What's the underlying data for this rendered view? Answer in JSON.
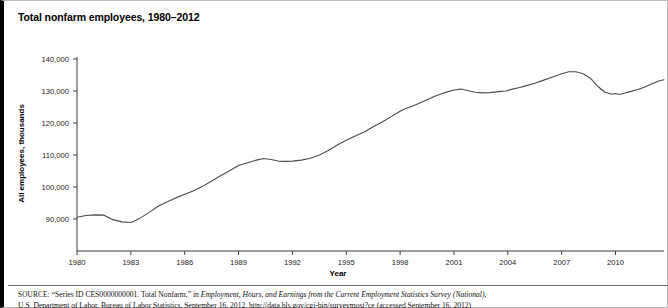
{
  "chart_title": "Total nonfarm employees, 1980–2012",
  "axis": {
    "y_title": "All employees, thousands",
    "x_title": "Year"
  },
  "source": {
    "label": "SOURCE:",
    "line1_plain_a": " “Series ID CES0000000001. Total Nonfarm,” in ",
    "line1_italic": "Employment, Hours, and Earnings from the Current Employment Statistics Survey (National),",
    "line2": "U.S. Department of Labor, Bureau of Labor Statistics, September 16, 2012, http://data.bls.gov/cgi-bin/surveymost?ce (accessed September 16, 2012)"
  },
  "chart_data": {
    "type": "line",
    "title": "Total nonfarm employees, 1980–2012",
    "xlabel": "Year",
    "ylabel": "All employees, thousands",
    "xlim": [
      1980,
      2012.7
    ],
    "ylim": [
      84000,
      142000
    ],
    "grid": false,
    "legend": "none",
    "x_ticks": [
      1980,
      1983,
      1986,
      1989,
      1992,
      1995,
      1998,
      2001,
      2004,
      2007,
      2010
    ],
    "y_ticks": [
      90000,
      100000,
      110000,
      120000,
      130000,
      140000
    ],
    "y_tick_labels": [
      "90,000",
      "100,000",
      "110,000",
      "120,000",
      "130,000",
      "140,000"
    ],
    "series": [
      {
        "name": "Total nonfarm employees",
        "color": "#4a4a4a",
        "x": [
          1980.0,
          1980.5,
          1981.0,
          1981.5,
          1982.0,
          1982.5,
          1983.0,
          1983.2,
          1983.5,
          1984.0,
          1984.5,
          1985.0,
          1985.5,
          1986.0,
          1986.5,
          1987.0,
          1987.5,
          1988.0,
          1988.5,
          1989.0,
          1989.5,
          1990.0,
          1990.4,
          1990.8,
          1991.2,
          1991.6,
          1992.0,
          1992.5,
          1993.0,
          1993.5,
          1994.0,
          1994.5,
          1995.0,
          1995.5,
          1996.0,
          1996.5,
          1997.0,
          1997.5,
          1998.0,
          1998.3,
          1998.6,
          1999.0,
          1999.5,
          2000.0,
          2000.5,
          2001.0,
          2001.4,
          2001.8,
          2002.2,
          2002.6,
          2003.0,
          2003.5,
          2003.9,
          2004.2,
          2004.6,
          2005.0,
          2005.5,
          2006.0,
          2006.5,
          2007.0,
          2007.4,
          2007.8,
          2008.2,
          2008.6,
          2009.0,
          2009.4,
          2009.8,
          2010.0,
          2010.2,
          2010.5,
          2010.8,
          2011.2,
          2011.6,
          2012.0,
          2012.4,
          2012.7
        ],
        "y": [
          90533,
          91100,
          91300,
          91200,
          89800,
          89100,
          88900,
          89400,
          90200,
          92000,
          93900,
          95300,
          96600,
          97700,
          98800,
          100200,
          101900,
          103500,
          105100,
          106700,
          107600,
          108400,
          108900,
          108600,
          108100,
          108000,
          108100,
          108400,
          109000,
          110000,
          111400,
          113100,
          114600,
          115900,
          117200,
          118800,
          120300,
          122000,
          123700,
          124500,
          125100,
          126000,
          127300,
          128500,
          129500,
          130300,
          130600,
          130100,
          129600,
          129400,
          129500,
          129800,
          130000,
          130500,
          131000,
          131600,
          132400,
          133400,
          134400,
          135400,
          136000,
          136000,
          135400,
          134000,
          131500,
          129700,
          129000,
          129200,
          128900,
          129300,
          129800,
          130400,
          131200,
          132200,
          133100,
          133500
        ]
      }
    ],
    "annotations": []
  }
}
